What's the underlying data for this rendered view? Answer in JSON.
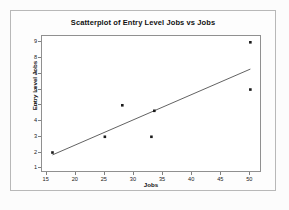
{
  "chart_data": {
    "type": "scatter",
    "title": "Scatterplot of Entry Level Jobs vs Jobs",
    "xlabel": "Jobs",
    "ylabel": "Entry Level Jobs",
    "xlim": [
      14.2,
      52.0
    ],
    "ylim": [
      0.7,
      9.4
    ],
    "xticks": [
      15,
      20,
      25,
      30,
      35,
      40,
      45,
      50
    ],
    "xtick_labels": [
      "15",
      "20",
      "25",
      "30",
      "35",
      "40",
      "45",
      "50"
    ],
    "yticks": [
      1,
      2,
      3,
      4,
      5,
      6,
      7,
      8,
      9
    ],
    "ytick_labels": [
      "1",
      "2",
      "3",
      "4",
      "5",
      "6",
      "7",
      "8",
      "9"
    ],
    "grid": false,
    "legend": null,
    "marker": "filled-square",
    "marker_color": "#1a1a1a",
    "points": [
      {
        "x": 16,
        "y": 2.0
      },
      {
        "x": 25,
        "y": 3.0
      },
      {
        "x": 28,
        "y": 5.0
      },
      {
        "x": 33,
        "y": 3.0
      },
      {
        "x": 33.5,
        "y": 4.65
      },
      {
        "x": 50,
        "y": 6.0
      },
      {
        "x": 50,
        "y": 9.0
      }
    ],
    "series": [
      {
        "name": "Entry Level Jobs",
        "x": [
          16,
          25,
          28,
          33,
          33.5,
          50,
          50
        ],
        "values": [
          2.0,
          3.0,
          5.0,
          3.0,
          4.65,
          6.0,
          9.0
        ]
      }
    ],
    "fit_line": {
      "type": "linear-regression",
      "color": "#3a3a3a",
      "x_start": 16,
      "y_start": 1.85,
      "x_end": 50,
      "y_end": 7.3
    }
  },
  "frame": {
    "border_color": "#b8b8b8",
    "plot_border_color": "#909090",
    "background": "#ffffff"
  }
}
